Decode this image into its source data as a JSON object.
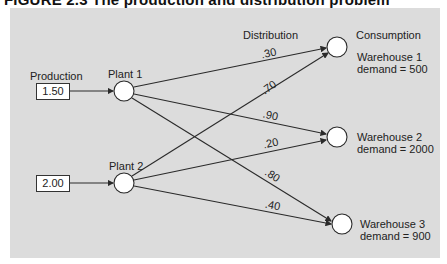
{
  "figure": {
    "title": "FIGURE 2.3   The production and distribution problem",
    "column_headers": {
      "production": "Production",
      "distribution": "Distribution",
      "consumption": "Consumption"
    },
    "plants": [
      {
        "name": "Plant 1",
        "production": "1.50"
      },
      {
        "name": "Plant 2",
        "production": "2.00"
      }
    ],
    "warehouses": [
      {
        "name": "Warehouse 1",
        "demand": "demand = 500"
      },
      {
        "name": "Warehouse 2",
        "demand": "demand = 2000"
      },
      {
        "name": "Warehouse 3",
        "demand": "demand = 900"
      }
    ],
    "flows": [
      {
        "from": "Plant 1",
        "to": "Warehouse 1",
        "value": ".30"
      },
      {
        "from": "Plant 2",
        "to": "Warehouse 1",
        "value": ".70"
      },
      {
        "from": "Plant 1",
        "to": "Warehouse 2",
        "value": ".90"
      },
      {
        "from": "Plant 2",
        "to": "Warehouse 2",
        "value": ".20"
      },
      {
        "from": "Plant 1",
        "to": "Warehouse 3",
        "value": ".80"
      },
      {
        "from": "Plant 2",
        "to": "Warehouse 3",
        "value": ".40"
      }
    ],
    "colors": {
      "panel": "#dcdcdc",
      "line": "#2a2a2a",
      "node": "#ffffff"
    }
  }
}
